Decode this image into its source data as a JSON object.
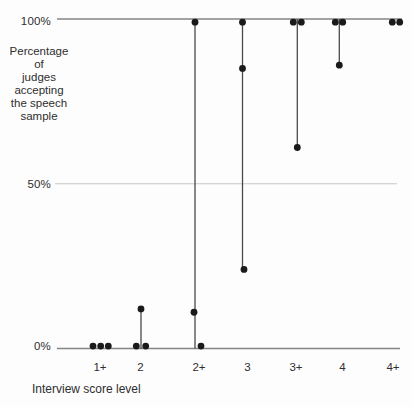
{
  "chart_data": {
    "type": "scatter",
    "xlabel": "Interview score level",
    "ylabel": "Percentage of judges accepting the speech sample",
    "ylabel_lines": [
      "Percentage",
      "of",
      "judges",
      "accepting",
      "the speech",
      "sample"
    ],
    "ylim": [
      0,
      100
    ],
    "y_ticks": [
      {
        "label": "100%",
        "pct": 100
      },
      {
        "label": "50%",
        "pct": 50
      },
      {
        "label": "0%",
        "pct": 0
      }
    ],
    "categories": [
      "1+",
      "2",
      "2+",
      "3",
      "3+",
      "4",
      "4+"
    ],
    "columns": [
      {
        "label": "1+",
        "x": 100.7,
        "label_x": 100,
        "line": null,
        "values_pct": [
          0,
          0,
          0
        ],
        "points": [
          {
            "pct": 0,
            "dx": -7.7
          },
          {
            "pct": 0,
            "dx": 0
          },
          {
            "pct": 0,
            "dx": 7.6
          }
        ]
      },
      {
        "label": "2",
        "x": 141,
        "label_x": 140.5,
        "line": {
          "top": 12,
          "bottom": 0
        },
        "values_pct": [
          12,
          0,
          0
        ],
        "points": [
          {
            "pct": 12,
            "dx": 0
          },
          {
            "pct": 0,
            "dx": -4.7
          },
          {
            "pct": 0,
            "dx": 4.7
          }
        ]
      },
      {
        "label": "2+",
        "x": 195,
        "label_x": 199,
        "line": {
          "top": 100,
          "bottom": 0
        },
        "values_pct": [
          100,
          11,
          0
        ],
        "points": [
          {
            "pct": 100,
            "dx": 0
          },
          {
            "pct": 11,
            "dx": -1
          },
          {
            "pct": 0,
            "dx": 6
          }
        ]
      },
      {
        "label": "3",
        "x": 242.5,
        "label_x": 247.5,
        "line": {
          "top": 100,
          "bottom": 24
        },
        "values_pct": [
          100,
          85,
          24
        ],
        "points": [
          {
            "pct": 100,
            "dx": 0
          },
          {
            "pct": 85,
            "dx": 0
          },
          {
            "pct": 24,
            "dx": 1.5
          }
        ]
      },
      {
        "label": "3+",
        "x": 297.3,
        "label_x": 296,
        "line": {
          "top": 100,
          "bottom": 61
        },
        "values_pct": [
          100,
          100,
          61
        ],
        "points": [
          {
            "pct": 100,
            "dx": -4
          },
          {
            "pct": 100,
            "dx": 4
          },
          {
            "pct": 61,
            "dx": 0
          }
        ]
      },
      {
        "label": "4",
        "x": 339.3,
        "label_x": 342.5,
        "line": {
          "top": 100,
          "bottom": 86
        },
        "values_pct": [
          100,
          100,
          86
        ],
        "points": [
          {
            "pct": 100,
            "dx": -4
          },
          {
            "pct": 100,
            "dx": 3.4
          },
          {
            "pct": 86,
            "dx": 0
          }
        ]
      },
      {
        "label": "4+",
        "x": 396,
        "label_x": 393,
        "line": null,
        "values_pct": [
          100,
          100
        ],
        "points": [
          {
            "pct": 100,
            "dx": -3.7
          },
          {
            "pct": 100,
            "dx": 3.7
          }
        ]
      }
    ],
    "axis_geometry": {
      "plot_left": 57,
      "plot_right": 402,
      "y_100": 19,
      "y_0": 348.5,
      "grid50_right": 397
    },
    "colors": {
      "dot": "#1a1a1a",
      "range_line": "#4a4a4a",
      "axis_line": "#858585",
      "grid50": "#c8c8c8",
      "text": "#2e2e2e"
    }
  }
}
